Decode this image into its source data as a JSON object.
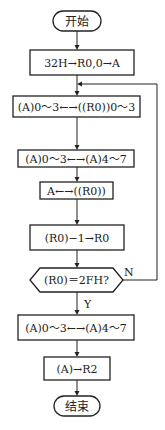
{
  "flowchart": {
    "start": {
      "label": "开始"
    },
    "steps": [
      {
        "label": "32H→R0,0→A"
      },
      {
        "label": "(A)0～3←→((R0))0～3"
      },
      {
        "label": "(A)0～3←→(A)4～7"
      },
      {
        "label": "A←→((R0))"
      },
      {
        "label": "(R0)−1→R0"
      }
    ],
    "decision": {
      "label": "(R0)＝2FH?",
      "yes_label": "Y",
      "no_label": "N"
    },
    "after_steps": [
      {
        "label": "(A)0～3←→(A)4～7"
      },
      {
        "label": "(A)→R2"
      }
    ],
    "end": {
      "label": "结束"
    }
  },
  "colors": {
    "stroke": "#222222",
    "background": "#ffffff"
  }
}
